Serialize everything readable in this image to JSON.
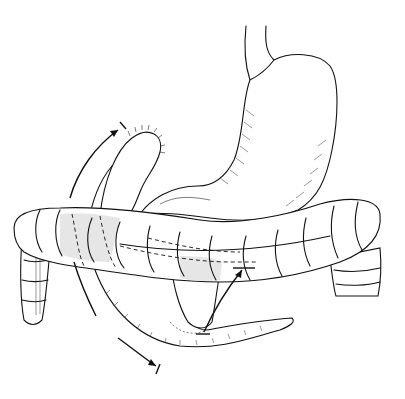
{
  "figure": {
    "background": "#ffffff",
    "stroke_color": "#111111",
    "elements": [
      "esophagus",
      "stomach",
      "sutured-bowel-stump",
      "transverse-colon",
      "ascending-colon",
      "descending-colon",
      "small-bowel-loop",
      "curved-arrow-upper-left",
      "curved-arrow-lower-left",
      "curved-arrow-lower-right",
      "dashed-outline-overlay"
    ]
  }
}
